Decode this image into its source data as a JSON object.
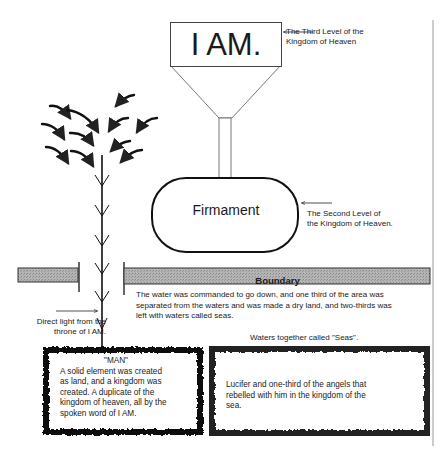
{
  "diagram": {
    "top_box": {
      "label": "I AM."
    },
    "third_level_note": {
      "line1": "The Third Level of the",
      "line2": "Kingdom of Heaven"
    },
    "firmament": {
      "label": "Firmament"
    },
    "second_level_note": {
      "line1": "The Second Level of",
      "line2": "the Kingdom of Heaven."
    },
    "boundary": {
      "label": "Boundary"
    },
    "water_paragraph": {
      "line1": "The water was commanded to go down, and one third of the area was",
      "line2": "separated from the waters and was made a dry land, and two-thirds was",
      "line3": "left with waters called seas."
    },
    "direct_light_note": {
      "line1": "Direct light from the",
      "line2": "throne of I AM."
    },
    "man_box": {
      "title": "\"MAN\"",
      "line1": "A solid element was created",
      "line2": "as land, and a kingdom was",
      "line3": "created. A duplicate of the",
      "line4": "kingdom of heaven, all by the",
      "line5": "spoken word of I AM."
    },
    "seas_title": "Waters together called \"Seas\".",
    "seas_box": {
      "line1": "Lucifer and one-third of the angels that",
      "line2": "rebelled with him in the kingdom of the",
      "line3": "sea."
    },
    "colors": {
      "boundary_fill": "#a8a8a8",
      "stroke": "#222222",
      "grunge_border": "#1a1a1a"
    }
  }
}
